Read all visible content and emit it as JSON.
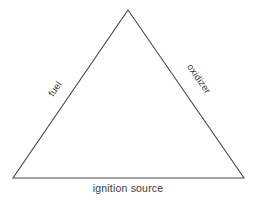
{
  "diagram": {
    "type": "triangle-diagram",
    "background_color": "#ffffff",
    "stroke_color": "#4a4a4a",
    "text_color": "#3b3b3b",
    "stroke_width": 1.1,
    "vertices": {
      "apex": {
        "x": 128,
        "y": 10
      },
      "bottom_left": {
        "x": 13,
        "y": 178
      },
      "bottom_right": {
        "x": 244,
        "y": 178
      }
    },
    "labels": {
      "left_edge": "fuel",
      "right_edge": "oxidizer",
      "bottom_edge": "ignition source"
    }
  }
}
